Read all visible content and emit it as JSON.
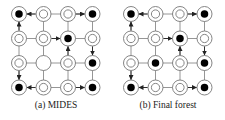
{
  "panels": [
    {
      "caption": "(a) MIDES",
      "origin_x": 19,
      "nodes": [
        [
          "filled",
          "double",
          "double",
          "filled"
        ],
        [
          "double",
          "double",
          "filled",
          "double"
        ],
        [
          "double",
          "empty",
          "double",
          "filled"
        ],
        [
          "filled",
          "double",
          "double",
          "filled"
        ]
      ],
      "arrows": [
        [
          0,
          1,
          0,
          0
        ],
        [
          0,
          2,
          0,
          3
        ],
        [
          1,
          0,
          0,
          0
        ],
        [
          1,
          1,
          1,
          2
        ],
        [
          2,
          2,
          1,
          2
        ],
        [
          1,
          3,
          2,
          3
        ],
        [
          2,
          0,
          3,
          0
        ],
        [
          3,
          1,
          3,
          0
        ],
        [
          3,
          2,
          3,
          3
        ]
      ]
    },
    {
      "caption": "(b) Final forest",
      "origin_x": 19,
      "nodes": [
        [
          "filled",
          "double",
          "double",
          "filled"
        ],
        [
          "double",
          "double",
          "filled",
          "double"
        ],
        [
          "double",
          "filled",
          "double",
          "filled"
        ],
        [
          "filled",
          "double",
          "double",
          "filled"
        ]
      ],
      "arrows": [
        [
          0,
          1,
          0,
          0
        ],
        [
          0,
          2,
          0,
          3
        ],
        [
          1,
          0,
          0,
          0
        ],
        [
          1,
          1,
          1,
          2
        ],
        [
          2,
          2,
          1,
          2
        ],
        [
          1,
          3,
          2,
          3
        ],
        [
          2,
          0,
          3,
          0
        ],
        [
          3,
          1,
          3,
          0
        ],
        [
          3,
          2,
          3,
          3
        ]
      ]
    }
  ],
  "grid": {
    "rows": 4,
    "cols": 4,
    "spacing": 24.5,
    "origin_y": 14,
    "radius": 7.5
  },
  "colors": {
    "line": "#8a8a8a",
    "ring": "#777777",
    "fill": "#000000",
    "arrow": "#222222"
  }
}
